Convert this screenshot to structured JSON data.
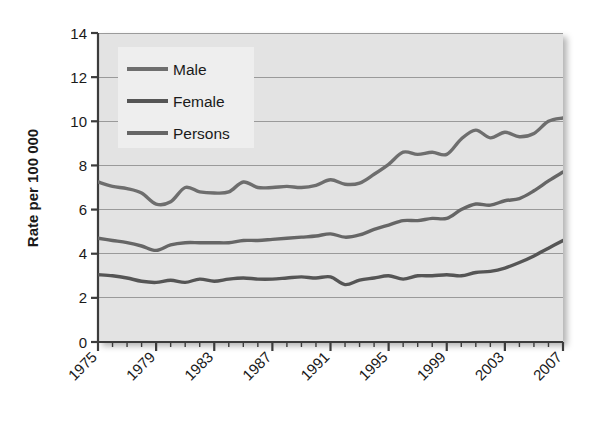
{
  "chart_data": {
    "type": "line",
    "title": "",
    "xlabel": "",
    "ylabel": "Rate per 100 000",
    "ylim": [
      0,
      14
    ],
    "xlim": [
      1975,
      2007
    ],
    "yticks": [
      0,
      2,
      4,
      6,
      8,
      10,
      12,
      14
    ],
    "ytick_labels": [
      "0",
      "2",
      "4",
      "6",
      "8",
      "10",
      "12",
      "14"
    ],
    "xticks": [
      1975,
      1979,
      1983,
      1987,
      1991,
      1995,
      1999,
      2003,
      2007
    ],
    "xtick_labels": [
      "1975",
      "1979",
      "1983",
      "1987",
      "1991",
      "1995",
      "1999",
      "2003",
      "2007"
    ],
    "grid": "horizontal",
    "legend_position": "top-left",
    "x": [
      1975,
      1976,
      1977,
      1978,
      1979,
      1980,
      1981,
      1982,
      1983,
      1984,
      1985,
      1986,
      1987,
      1988,
      1989,
      1990,
      1991,
      1992,
      1993,
      1994,
      1995,
      1996,
      1997,
      1998,
      1999,
      2000,
      2001,
      2002,
      2003,
      2004,
      2005,
      2006,
      2007
    ],
    "series": [
      {
        "name": "Male",
        "color": "#6e6e6e",
        "values": [
          7.25,
          7.05,
          6.95,
          6.75,
          6.25,
          6.35,
          7.0,
          6.8,
          6.75,
          6.8,
          7.25,
          7.0,
          7.0,
          7.05,
          7.0,
          7.1,
          7.35,
          7.15,
          7.2,
          7.6,
          8.05,
          8.6,
          8.5,
          8.6,
          8.5,
          9.2,
          9.6,
          9.25,
          9.5,
          9.3,
          9.45,
          10.0,
          10.15
        ]
      },
      {
        "name": "Female",
        "color": "#555555",
        "values": [
          3.05,
          3.0,
          2.9,
          2.75,
          2.7,
          2.8,
          2.7,
          2.85,
          2.75,
          2.85,
          2.9,
          2.85,
          2.85,
          2.9,
          2.95,
          2.9,
          2.95,
          2.6,
          2.8,
          2.9,
          3.0,
          2.85,
          3.0,
          3.0,
          3.05,
          3.0,
          3.15,
          3.2,
          3.35,
          3.6,
          3.9,
          4.25,
          4.6
        ]
      },
      {
        "name": "Persons",
        "color": "#666666",
        "values": [
          4.7,
          4.6,
          4.5,
          4.35,
          4.15,
          4.4,
          4.5,
          4.5,
          4.5,
          4.5,
          4.6,
          4.6,
          4.65,
          4.7,
          4.75,
          4.8,
          4.9,
          4.75,
          4.85,
          5.1,
          5.3,
          5.5,
          5.5,
          5.6,
          5.6,
          6.0,
          6.25,
          6.2,
          6.4,
          6.5,
          6.85,
          7.3,
          7.7
        ]
      }
    ],
    "series_endpoints": {
      "Male": 12.0,
      "Female": 5.2,
      "Persons": 8.5
    },
    "colors": {
      "plot_background": "#e3e3e3",
      "gridline": "#9a9a9a",
      "axis": "#3c3c3c",
      "legend_background": "#eeeeee",
      "page_background": "#ffffff"
    }
  },
  "legend": {
    "items": [
      {
        "label": "Male"
      },
      {
        "label": "Female"
      },
      {
        "label": "Persons"
      }
    ]
  }
}
